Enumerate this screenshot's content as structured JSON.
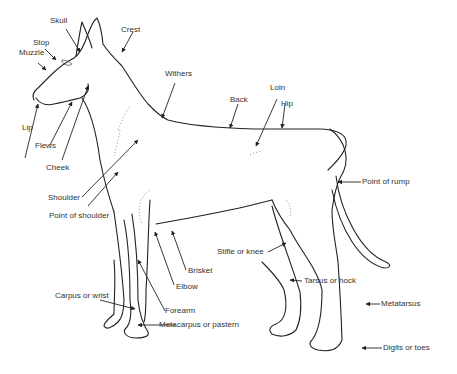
{
  "diagram": {
    "labels": {
      "skull": "Skull",
      "crest": "Crest",
      "stop": "Stop",
      "muzzle": "Muzzle",
      "withers": "Withers",
      "loin": "Loin",
      "hip": "Hip",
      "back": "Back",
      "lip": "Lip",
      "flews": "Flews",
      "cheek": "Cheek",
      "point_of_rump": "Point of rump",
      "shoulder": "Shoulder",
      "point_of_shoulder": "Point of shoulder",
      "stifle": "Stifle or knee",
      "brisket": "Brisket",
      "elbow": "Elbow",
      "tarsus": "Tarsus or hock",
      "carpus": "Carpus or wrist",
      "forearm": "Forearm",
      "metatarsus": "Metatarsus",
      "metacarpus": "Metacarpus or pastern",
      "digits": "Digits or toes"
    },
    "colors": {
      "line": "#222222",
      "text": "#333333",
      "background": "#ffffff"
    }
  }
}
